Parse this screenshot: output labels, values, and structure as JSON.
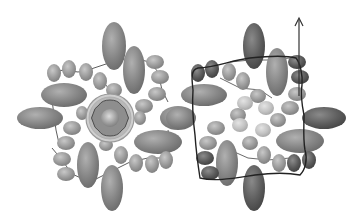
{
  "figure": {
    "panels": [
      {
        "id": "left",
        "description": "assembly top view with central ring channel"
      },
      {
        "id": "right",
        "description": "assembly view with traced path and arrow"
      }
    ],
    "colors": {
      "background": "#ffffff",
      "ellipsoid": "#8a8a8a",
      "bead": "#9a9a9a",
      "bead_light": "#c4c4c4",
      "bead_dark": "#555555",
      "ellipsoid_dark": "#606060",
      "linker": "#333333",
      "path": "#222222",
      "ring": "#d0d0d0"
    }
  }
}
